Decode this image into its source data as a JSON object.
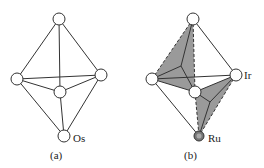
{
  "figure_a": {
    "label": "(a)",
    "atom_label": "Os",
    "nodes": {
      "top": [
        59,
        19
      ],
      "left": [
        17,
        79
      ],
      "right": [
        101,
        75
      ],
      "center": [
        60,
        92
      ],
      "bottom": [
        64,
        136
      ]
    }
  },
  "figure_b": {
    "label": "(b)",
    "atom_labels": {
      "ir": "Ir",
      "ru": "Ru"
    },
    "nodes": {
      "top": [
        193,
        19
      ],
      "left": [
        152,
        79
      ],
      "right": [
        236,
        75
      ],
      "center": [
        195,
        92
      ],
      "bottom": [
        199,
        136
      ]
    },
    "shade_color": "#9a9a9a"
  },
  "colors": {
    "line": "#333333",
    "node_fill": "#ffffff",
    "ru_fill": "#777777"
  }
}
